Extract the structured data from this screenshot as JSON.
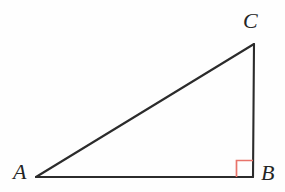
{
  "figure": {
    "kind": "geometry-diagram",
    "shape": "right-triangle",
    "background_color": "#fefefe",
    "stroke_color": "#2b2b2b",
    "stroke_width": 2,
    "right_angle_color": "#e8736a",
    "width": 285,
    "height": 192
  },
  "labels": {
    "vertex_a": "A",
    "vertex_b": "B",
    "vertex_c": "C"
  },
  "chart_data": {
    "type": "scatter",
    "title": "",
    "xlabel": "",
    "ylabel": "",
    "grid": false,
    "legend": "none",
    "vertices": [
      {
        "name": "A",
        "x": 36,
        "y": 177,
        "label": "A",
        "angle": "acute"
      },
      {
        "name": "B",
        "x": 253,
        "y": 177,
        "label": "B",
        "angle": "right"
      },
      {
        "name": "C",
        "x": 254,
        "y": 44,
        "label": "C",
        "angle": "acute"
      }
    ],
    "edges": [
      {
        "name": "AB",
        "from": "A",
        "to": "B",
        "role": "base-leg"
      },
      {
        "name": "BC",
        "from": "B",
        "to": "C",
        "role": "vertical-leg"
      },
      {
        "name": "CA",
        "from": "C",
        "to": "A",
        "role": "hypotenuse"
      }
    ],
    "right_angle_marker": {
      "at_vertex": "B",
      "size": 17,
      "x": 236,
      "y": 160,
      "color": "#e8736a"
    }
  }
}
